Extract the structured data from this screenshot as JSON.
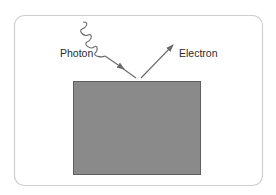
{
  "diagram": {
    "type": "photoelectric-effect",
    "labels": {
      "photon": "Photon",
      "electron": "Electron"
    },
    "colors": {
      "frame_border": "#cfcfcf",
      "background": "#ffffff",
      "plate_fill": "#8a8a8a",
      "plate_border": "#5e5e5e",
      "line": "#6a6a6a",
      "text": "#2a2a2a"
    },
    "elements": [
      {
        "id": "frame",
        "kind": "rounded-rectangle"
      },
      {
        "id": "plate",
        "kind": "rectangle",
        "description": "metal surface"
      },
      {
        "id": "photon",
        "kind": "wavy-line-with-arrow",
        "direction": "incoming",
        "label": "Photon"
      },
      {
        "id": "electron",
        "kind": "arrow",
        "direction": "outgoing",
        "label": "Electron"
      }
    ]
  }
}
